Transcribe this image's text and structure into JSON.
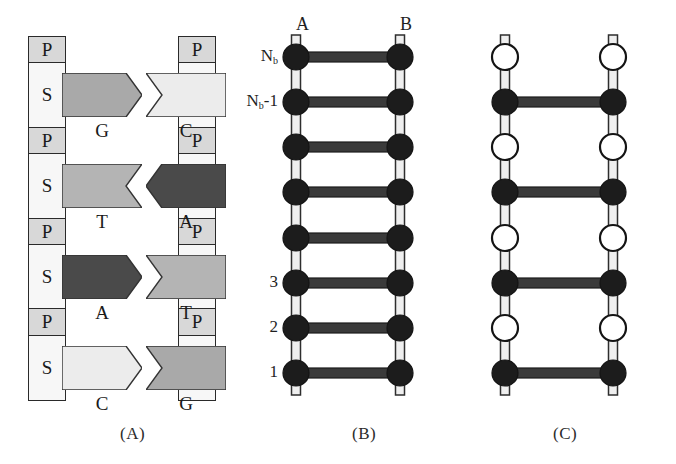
{
  "figure": {
    "panels": [
      {
        "id": "A",
        "caption": "(A)",
        "caption_x": 120,
        "caption_y": 424
      },
      {
        "id": "B",
        "caption": "(B)",
        "caption_x": 352,
        "caption_y": 424
      },
      {
        "id": "C",
        "caption": "(C)",
        "caption_x": 553,
        "caption_y": 424
      }
    ]
  },
  "panel_a": {
    "left_backbone": [
      {
        "label": "P",
        "type": "phosphate"
      },
      {
        "label": "S",
        "type": "sugar"
      },
      {
        "label": "P",
        "type": "phosphate"
      },
      {
        "label": "S",
        "type": "sugar"
      },
      {
        "label": "P",
        "type": "phosphate"
      },
      {
        "label": "S",
        "type": "sugar"
      },
      {
        "label": "P",
        "type": "phosphate"
      },
      {
        "label": "S",
        "type": "sugar"
      }
    ],
    "right_backbone": [
      {
        "label": "P",
        "type": "phosphate"
      },
      {
        "label": "S",
        "type": "sugar"
      },
      {
        "label": "P",
        "type": "phosphate"
      },
      {
        "label": "S",
        "type": "sugar"
      },
      {
        "label": "P",
        "type": "phosphate"
      },
      {
        "label": "S",
        "type": "sugar"
      },
      {
        "label": "P",
        "type": "phosphate"
      },
      {
        "label": "S",
        "type": "sugar"
      }
    ],
    "base_pairs": [
      {
        "left": {
          "letter": "G",
          "shade": "#a9a9a9",
          "shape": "point-right"
        },
        "right": {
          "letter": "C",
          "shade": "#ececec",
          "shape": "notch-left"
        }
      },
      {
        "left": {
          "letter": "T",
          "shade": "#b4b4b4",
          "shape": "notch-right"
        },
        "right": {
          "letter": "A",
          "shade": "#4a4a4a",
          "shape": "point-left"
        }
      },
      {
        "left": {
          "letter": "A",
          "shade": "#4a4a4a",
          "shape": "point-right"
        },
        "right": {
          "letter": "T",
          "shade": "#b4b4b4",
          "shape": "notch-left"
        }
      },
      {
        "left": {
          "letter": "C",
          "shade": "#ececec",
          "shape": "point-right"
        },
        "right": {
          "letter": "G",
          "shade": "#a9a9a9",
          "shape": "notch-left"
        }
      }
    ]
  },
  "panel_b": {
    "strand_labels": [
      {
        "text": "A",
        "x": 296,
        "y": 14
      },
      {
        "text": "B",
        "x": 400,
        "y": 14
      }
    ],
    "rung_labels": [
      {
        "text": "N",
        "sub": "b",
        "suffix": "",
        "y": 57
      },
      {
        "text": "N",
        "sub": "b",
        "suffix": "-1",
        "y": 102
      },
      {
        "text": "3",
        "sub": "",
        "suffix": "",
        "y": 283
      },
      {
        "text": "2",
        "sub": "",
        "suffix": "",
        "y": 328
      },
      {
        "text": "1",
        "sub": "",
        "suffix": "",
        "y": 373
      }
    ],
    "site_count": 8,
    "sites": [
      {
        "y": 57,
        "left": "filled",
        "right": "filled",
        "rung": true
      },
      {
        "y": 102,
        "left": "filled",
        "right": "filled",
        "rung": true
      },
      {
        "y": 147,
        "left": "filled",
        "right": "filled",
        "rung": true
      },
      {
        "y": 192,
        "left": "filled",
        "right": "filled",
        "rung": true
      },
      {
        "y": 238,
        "left": "filled",
        "right": "filled",
        "rung": true
      },
      {
        "y": 283,
        "left": "filled",
        "right": "filled",
        "rung": true
      },
      {
        "y": 328,
        "left": "filled",
        "right": "filled",
        "rung": true
      },
      {
        "y": 373,
        "left": "filled",
        "right": "filled",
        "rung": true
      }
    ]
  },
  "panel_c": {
    "site_count": 8,
    "sites": [
      {
        "y": 57,
        "left": "open",
        "right": "open",
        "rung": false
      },
      {
        "y": 102,
        "left": "filled",
        "right": "filled",
        "rung": true
      },
      {
        "y": 147,
        "left": "open",
        "right": "open",
        "rung": false
      },
      {
        "y": 192,
        "left": "filled",
        "right": "filled",
        "rung": true
      },
      {
        "y": 238,
        "left": "open",
        "right": "open",
        "rung": false
      },
      {
        "y": 283,
        "left": "filled",
        "right": "filled",
        "rung": true
      },
      {
        "y": 328,
        "left": "open",
        "right": "open",
        "rung": false
      },
      {
        "y": 373,
        "left": "filled",
        "right": "filled",
        "rung": true
      }
    ]
  },
  "colors": {
    "ink": "#1a1a1a",
    "node_fill": "#1c1c1c",
    "node_open": "#ffffff",
    "backbone_light": "#efefef",
    "rung_dark": "#3a3a3a"
  }
}
